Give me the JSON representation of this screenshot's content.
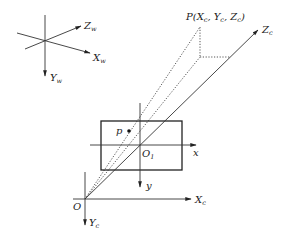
{
  "diagram": {
    "type": "camera-projection-model",
    "colors": {
      "line": "#333333",
      "background": "#ffffff"
    },
    "world_frame": {
      "axes": [
        {
          "name": "Z",
          "sub": "w"
        },
        {
          "name": "X",
          "sub": "w"
        },
        {
          "name": "Y",
          "sub": "w"
        }
      ]
    },
    "camera_frame": {
      "origin_label": "O",
      "axes": [
        {
          "name": "X",
          "sub": "c"
        },
        {
          "name": "Y",
          "sub": "c"
        },
        {
          "name": "Z",
          "sub": "c"
        }
      ]
    },
    "image_plane": {
      "origin": {
        "name": "O",
        "sub": "1"
      },
      "axes": [
        {
          "name": "x"
        },
        {
          "name": "y"
        }
      ],
      "image_point_label": "p"
    },
    "world_point": {
      "label": "P(X",
      "parts": [
        "P(X",
        "c",
        ", Y",
        "c",
        ", Z",
        "c",
        ")"
      ]
    }
  }
}
